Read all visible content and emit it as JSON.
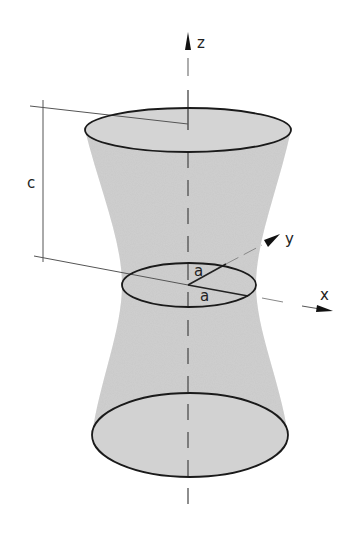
{
  "diagram": {
    "labels": {
      "z_axis": "z",
      "y_axis": "y",
      "x_axis": "x",
      "height": "c",
      "radius_1": "a",
      "radius_2": "a"
    },
    "colors": {
      "surface_fill": "#c8c8c8",
      "outline": "#1a1a1a",
      "axis": "#555555",
      "background": "#ffffff"
    },
    "geometry": {
      "top_ellipse": {
        "cx": 188,
        "cy": 130,
        "rx": 103,
        "ry": 22
      },
      "waist_ellipse": {
        "cx": 188,
        "cy": 285,
        "rx": 67,
        "ry": 22
      },
      "bottom_ellipse": {
        "cx": 190,
        "cy": 435,
        "rx": 98,
        "ry": 42
      }
    }
  }
}
